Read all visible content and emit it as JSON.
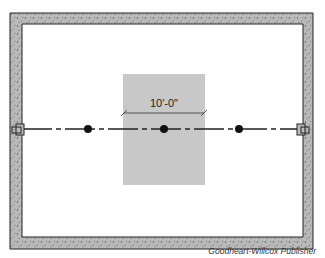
{
  "diagram": {
    "type": "floor plan - basement beam layout",
    "dimension_label": "10′-0″",
    "elements": [
      "foundation wall (concrete)",
      "beam pockets (left & right)",
      "beam centerline",
      "3 support columns",
      "shaded 10-ft span area"
    ],
    "colors": {
      "wall_fill": "#b8b8b8",
      "shade_area": "#c8c8c8",
      "line": "#222222",
      "background": "#ffffff"
    }
  },
  "credit": "Goodheart-Willcox Publisher"
}
